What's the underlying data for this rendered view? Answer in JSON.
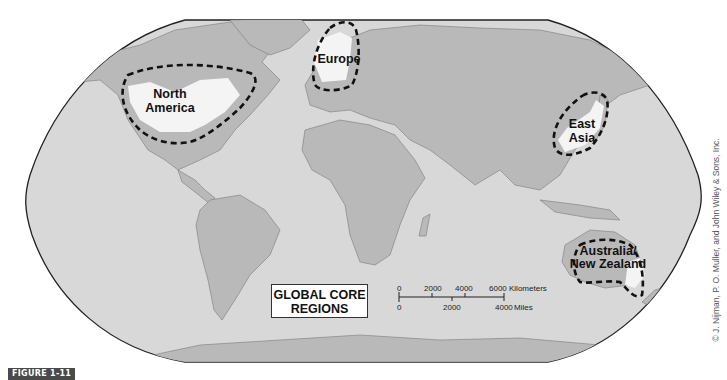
{
  "figure": {
    "label": "FIGURE 1-11",
    "legend_title_line1": "GLOBAL CORE",
    "legend_title_line2": "REGIONS",
    "copyright": "© J. Nijman, P. O. Muller, and John Wiley & Sons, Inc."
  },
  "regions": [
    {
      "id": "north-america",
      "line1": "North",
      "line2": "America"
    },
    {
      "id": "europe",
      "line1": "Europe",
      "line2": ""
    },
    {
      "id": "east-asia",
      "line1": "East",
      "line2": "Asia"
    },
    {
      "id": "australia-nz",
      "line1": "Australia/",
      "line2": "New Zealand"
    }
  ],
  "scale_bar": {
    "km_ticks": [
      "0",
      "2000",
      "4000",
      "6000"
    ],
    "km_unit": "Kilometers",
    "mi_ticks": [
      "0",
      "2000",
      "4000"
    ],
    "mi_unit": "Miles"
  },
  "colors": {
    "ocean": "#d8d8d8",
    "land": "#b9b9b9",
    "core_region": "#f4f4f4",
    "border": "#777777",
    "outline": "#222222",
    "badge": "#4a4a4a"
  }
}
